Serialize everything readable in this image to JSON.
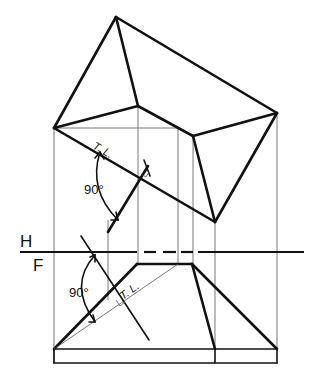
{
  "figure": {
    "type": "descriptive-geometry-orthographic-projection",
    "planes": {
      "top": "H",
      "bottom": "F"
    },
    "labels": {
      "angle_top": "90°",
      "angle_bottom": "90°",
      "true_length_top": "T. L.",
      "true_length_bottom": "T. L."
    },
    "colors": {
      "ink": "#111111",
      "projector": "#555555",
      "background": "#ffffff"
    }
  }
}
